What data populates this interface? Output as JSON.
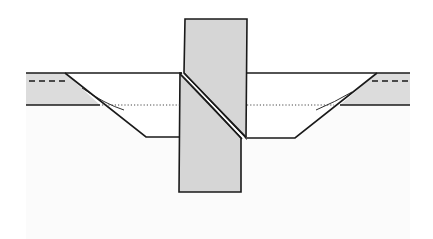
{
  "diagram": {
    "type": "geologic-cross-section",
    "colors": {
      "background": "#ffffff",
      "lower_ground": "#fbfbfb",
      "layer_fill": "#dcdcdc",
      "block_fill": "#d6d6d6",
      "stroke": "#1a1a1a"
    },
    "elements": {
      "layer_band": {
        "label": "",
        "top_y": 73,
        "bottom_y": 105
      },
      "upper_block": {
        "label": ""
      },
      "lower_block": {
        "label": ""
      },
      "fault_plane": {
        "label": ""
      },
      "left_basin": {
        "label": ""
      },
      "right_basin": {
        "label": ""
      },
      "water_level_line": {
        "style": "dotted"
      },
      "marker_lines": {
        "style": "dashed"
      }
    }
  }
}
